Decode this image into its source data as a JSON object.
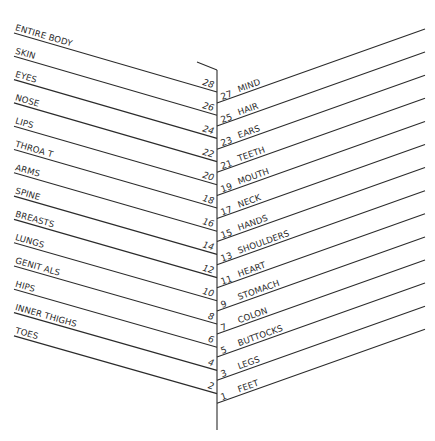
{
  "diagram": {
    "type": "fishbone-body-map",
    "spine": {
      "x": 217,
      "y_top": 70,
      "y_bottom": 430
    },
    "top_cap": {
      "x1": 197,
      "y1": 62,
      "x2": 217,
      "y2": 70
    },
    "left": {
      "items": [
        {
          "label": "ENTIRE BODY",
          "number": "28"
        },
        {
          "label": "SKIN",
          "number": "26"
        },
        {
          "label": "EYES",
          "number": "24"
        },
        {
          "label": "NOSE",
          "number": "22"
        },
        {
          "label": "LIPS",
          "number": "20"
        },
        {
          "label": "THROA T",
          "number": "18"
        },
        {
          "label": "ARMS",
          "number": "16"
        },
        {
          "label": "SPINE",
          "number": "14"
        },
        {
          "label": "BREASTS",
          "number": "12"
        },
        {
          "label": "LUNGS",
          "number": "10"
        },
        {
          "label": "GENIT ALS",
          "number": "8"
        },
        {
          "label": "HIPS",
          "number": "6"
        },
        {
          "label": "INNER THIGHS",
          "number": "4"
        },
        {
          "label": "TOES",
          "number": "2"
        }
      ]
    },
    "right": {
      "items": [
        {
          "label": "MIND",
          "number": "27"
        },
        {
          "label": "HAIR",
          "number": "25"
        },
        {
          "label": "EARS",
          "number": "23"
        },
        {
          "label": "TEETH",
          "number": "21"
        },
        {
          "label": "MOUTH",
          "number": "19"
        },
        {
          "label": "NECK",
          "number": "17"
        },
        {
          "label": "HANDS",
          "number": "15"
        },
        {
          "label": "SHOULDERS",
          "number": "13"
        },
        {
          "label": "HEART",
          "number": "11"
        },
        {
          "label": "STOMACH",
          "number": "9"
        },
        {
          "label": "COLON",
          "number": "7"
        },
        {
          "label": "BUTTOCKS",
          "number": "5"
        },
        {
          "label": "LEGS",
          "number": "3"
        },
        {
          "label": "FEET",
          "number": "1"
        }
      ]
    },
    "colors": {
      "line": "#2b2b2b",
      "text": "#2a2a2a",
      "background": "#ffffff"
    }
  }
}
